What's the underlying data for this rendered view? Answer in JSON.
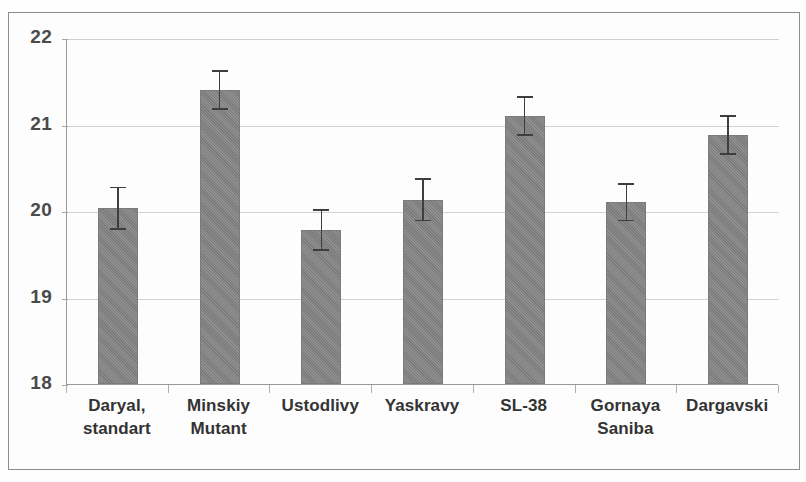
{
  "chart_data": {
    "type": "bar",
    "title": "",
    "subtitle": "",
    "xlabel": "",
    "ylabel": "",
    "ylim": [
      18,
      22
    ],
    "ytick_labels": [
      "22",
      "21",
      "20",
      "19",
      "18"
    ],
    "ytick_values": [
      22,
      21,
      20,
      19,
      18
    ],
    "grid": true,
    "legend": false,
    "legend_position": "none",
    "error_bars": "symmetric",
    "bar_color": "#838383",
    "error_bar_color": "#3e3e3e",
    "gridline_color": "#d2d2d2",
    "axis_color": "#9a9a9a",
    "frame_color": "#8d8d8d",
    "label_color": "#333333",
    "tick_label_color": "#4a4a4a",
    "categories": [
      "Daryal, standart",
      "Minskiy Mutant",
      "Ustodlivy",
      "Yaskravy",
      "SL-38",
      "Gornaya Saniba",
      "Dargavski"
    ],
    "category_lines": [
      [
        "Daryal,",
        "standart"
      ],
      [
        "Minskiy",
        "Mutant"
      ],
      [
        "Ustodlivy"
      ],
      [
        "Yaskravy"
      ],
      [
        "SL-38"
      ],
      [
        "Gornaya",
        "Saniba"
      ],
      [
        "Dargavski"
      ]
    ],
    "values": [
      20.03,
      21.4,
      19.78,
      20.13,
      21.1,
      20.1,
      20.88
    ],
    "errors": [
      0.25,
      0.23,
      0.24,
      0.25,
      0.23,
      0.22,
      0.23
    ]
  }
}
